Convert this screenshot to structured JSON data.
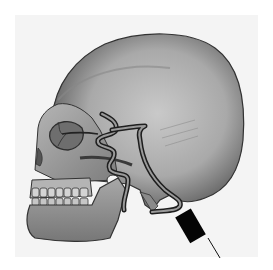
{
  "figure": {
    "colors": {
      "background": "#ffffff",
      "panel": "#f4f4f4",
      "bone_light": "#c8c8c8",
      "bone_mid": "#9a9a9a",
      "bone_dark": "#3a3a3a",
      "vessel": "#2a2a2a",
      "probe": "#050505"
    },
    "parts": [
      "cranium",
      "orbit",
      "zygomatic-arch",
      "maxilla-teeth",
      "mandible",
      "mastoid",
      "artery-anterior",
      "artery-posterior",
      "probe",
      "probe-cable"
    ]
  }
}
